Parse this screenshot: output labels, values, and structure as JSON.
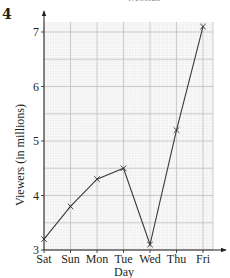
{
  "page": {
    "question_number": "4",
    "cropped_title_fragment": "Month"
  },
  "style": {
    "grid_minor_color": "#e2e2e2",
    "grid_major_color": "#b9b9b9",
    "grid_background": "#efefef",
    "axis_color": "#231f20",
    "line_color": "#3a3a3a"
  },
  "chart_data": {
    "type": "line",
    "title": "",
    "xlabel": "Day",
    "ylabel": "Viewers (in millions)",
    "categories": [
      "Sat",
      "Sun",
      "Mon",
      "Tue",
      "Wed",
      "Thu",
      "Fri"
    ],
    "series": [
      {
        "name": "Viewers",
        "values": [
          3.2,
          3.8,
          4.3,
          4.5,
          3.1,
          5.2,
          7.1
        ],
        "marker": "x"
      }
    ],
    "y_ticks": [
      3,
      4,
      5,
      6,
      7
    ],
    "ylim": [
      3,
      7.2
    ],
    "grid": true,
    "legend": "none"
  }
}
